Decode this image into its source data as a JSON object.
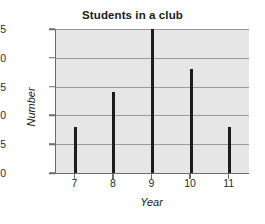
{
  "chart_data": {
    "type": "bar",
    "title": "Students in a club",
    "xlabel": "Year",
    "ylabel": "Number",
    "categories": [
      "7",
      "8",
      "9",
      "10",
      "11"
    ],
    "values": [
      8,
      14,
      25,
      18,
      8
    ],
    "ylim": [
      0,
      25
    ],
    "yticks": [
      0,
      5,
      10,
      15,
      20,
      25
    ],
    "ytick_labels": [
      "0",
      "5",
      "10",
      "15",
      "20",
      "25"
    ],
    "xtick_labels": [
      "7",
      "8",
      "9",
      "10",
      "11"
    ],
    "grid": "horizontal",
    "legend": "none",
    "series": [
      {
        "name": "Number",
        "values": [
          8,
          14,
          25,
          18,
          8
        ]
      }
    ],
    "colors": {
      "bar": "#1c1c1c",
      "plot_background": "#e6e6e6",
      "gridline": "#9a9a9a",
      "axis": "#6b6b6b",
      "figure_background": "#ffffff",
      "text": "#1a1a1a"
    }
  }
}
